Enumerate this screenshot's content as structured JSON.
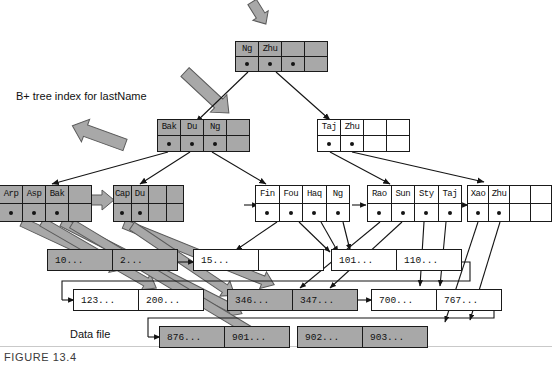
{
  "figure": {
    "caption": "FIGURE 13.4",
    "index_label": "B+ tree index for lastName",
    "data_file_label": "Data file"
  },
  "colors": {
    "filled_node": "#a8a8a8",
    "empty_node": "#ffffff",
    "border": "#1a1a1a",
    "thick_arrow": "#a8a8a8",
    "thick_arrow_border": "#4a4a4a",
    "thin_arrow": "#141414"
  },
  "tree": {
    "root": {
      "name": "root-node",
      "shaded": true,
      "keys": [
        "Ng",
        "Zhu",
        "",
        ""
      ],
      "pointers": [
        true,
        true,
        true,
        false
      ]
    },
    "internal": [
      {
        "name": "internal-node-left",
        "shaded": true,
        "keys": [
          "Bak",
          "Du",
          "Ng",
          ""
        ],
        "pointers": [
          true,
          true,
          true,
          false
        ]
      },
      {
        "name": "internal-node-right",
        "shaded": false,
        "keys": [
          "Taj",
          "Zhu",
          "",
          ""
        ],
        "pointers": [
          true,
          true,
          false,
          false
        ]
      }
    ],
    "leaves": [
      {
        "name": "leaf-node-1",
        "shaded": true,
        "keys": [
          "Arp",
          "Asp",
          "Bak",
          ""
        ],
        "pointers": [
          true,
          true,
          true,
          false
        ]
      },
      {
        "name": "leaf-node-2",
        "shaded": true,
        "keys": [
          "Cap",
          "Du",
          "",
          ""
        ],
        "pointers": [
          true,
          true,
          false,
          false
        ]
      },
      {
        "name": "leaf-node-3",
        "shaded": false,
        "keys": [
          "Fin",
          "Fou",
          "Haq",
          "Ng"
        ],
        "pointers": [
          true,
          true,
          true,
          true
        ]
      },
      {
        "name": "leaf-node-4",
        "shaded": false,
        "keys": [
          "Rao",
          "Sun",
          "Sty",
          "Taj"
        ],
        "pointers": [
          true,
          true,
          true,
          true
        ]
      },
      {
        "name": "leaf-node-5",
        "shaded": false,
        "keys": [
          "Xao",
          "Zhu",
          "",
          ""
        ],
        "pointers": [
          true,
          true,
          false,
          false
        ]
      }
    ]
  },
  "data_file": {
    "rows": [
      {
        "name": "data-row-1",
        "blocks": [
          {
            "name": "data-block-1",
            "shaded": true,
            "records": [
              "10...",
              "2..."
            ]
          },
          {
            "name": "data-block-2",
            "shaded": false,
            "records": [
              "15...",
              ""
            ]
          },
          {
            "name": "data-block-3",
            "shaded": false,
            "records": [
              "101...",
              "110..."
            ]
          }
        ]
      },
      {
        "name": "data-row-2",
        "blocks": [
          {
            "name": "data-block-4",
            "shaded": false,
            "records": [
              "123...",
              "200..."
            ]
          },
          {
            "name": "data-block-5",
            "shaded": true,
            "records": [
              "346...",
              "347..."
            ]
          },
          {
            "name": "data-block-6",
            "shaded": false,
            "records": [
              "700...",
              "767..."
            ]
          }
        ]
      },
      {
        "name": "data-row-3",
        "blocks": [
          {
            "name": "data-block-7",
            "shaded": true,
            "records": [
              "876...",
              "901..."
            ]
          },
          {
            "name": "data-block-8",
            "shaded": true,
            "records": [
              "902...",
              "903..."
            ]
          }
        ]
      }
    ]
  }
}
